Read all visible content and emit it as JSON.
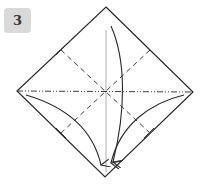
{
  "step": {
    "number": "3",
    "badge_color": "#d9d9d9",
    "number_color": "#3a3a3a"
  },
  "diagram": {
    "stroke_color": "#2a2a2a",
    "paper_color": "#ffffff",
    "square_vertices": {
      "top": [
        106,
        7
      ],
      "right": [
        193,
        92
      ],
      "bottom": [
        105,
        177
      ],
      "left": [
        17,
        91
      ]
    },
    "center": [
      106,
      91
    ],
    "fold_lines": [
      {
        "type": "mountain",
        "style": "dash-dot",
        "from": [
          17,
          91
        ],
        "to": [
          193,
          92
        ]
      },
      {
        "type": "valley",
        "style": "dashed",
        "from": [
          61,
          50
        ],
        "to": [
          150,
          133
        ]
      },
      {
        "type": "valley",
        "style": "dashed",
        "from": [
          150,
          50
        ],
        "to": [
          61,
          133
        ]
      }
    ],
    "reference_line": {
      "type": "crease",
      "style": "thin-solid",
      "from": [
        106,
        30
      ],
      "to": [
        106,
        172
      ]
    },
    "arrows": [
      {
        "name": "top-to-bottom-fold",
        "style": "curved",
        "from": [
          111,
          26
        ],
        "to": [
          113,
          162
        ]
      },
      {
        "name": "left-to-bottom-fold",
        "style": "curved",
        "from": [
          26,
          95
        ],
        "to": [
          101,
          165
        ]
      },
      {
        "name": "right-to-bottom-fold",
        "style": "curved",
        "from": [
          184,
          95
        ],
        "to": [
          111,
          163
        ]
      }
    ]
  }
}
